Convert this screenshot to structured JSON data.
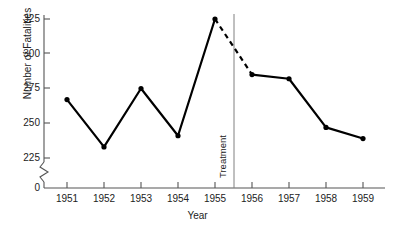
{
  "chart_data": {
    "type": "line",
    "title": "",
    "xlabel": "Year",
    "ylabel": "Number of Fatalities",
    "categories": [
      "1951",
      "1952",
      "1953",
      "1954",
      "1955",
      "1956",
      "1957",
      "1958",
      "1959"
    ],
    "values": [
      267,
      233,
      275,
      241,
      325,
      285,
      282,
      247,
      239
    ],
    "series": [
      {
        "name": "Number of Fatalities",
        "values": [
          267,
          233,
          275,
          241,
          325,
          285,
          282,
          247,
          239
        ]
      }
    ],
    "ylim": [
      225,
      325
    ],
    "yticks": [
      "0",
      "225",
      "250",
      "275",
      "300",
      "325"
    ],
    "ytick_values": [
      0,
      225,
      250,
      275,
      300,
      325
    ],
    "xticks": [
      "1951",
      "1952",
      "1953",
      "1954",
      "1955",
      "1956",
      "1957",
      "1958",
      "1959"
    ],
    "axis_break": true,
    "axis_break_label": "0",
    "grid": false,
    "legend": "none",
    "line_color": "#000000",
    "marker_color": "#000000",
    "axis_color": "#555555",
    "annotations": [
      {
        "name": "treatment-line",
        "label": "Treatment",
        "x_position": "between 1955 and 1956",
        "style": "vertical-line"
      },
      {
        "name": "dashed-transition",
        "label": "",
        "from": "1955",
        "to": "1956",
        "style": "dashed-segment"
      }
    ]
  },
  "chart": {
    "y_axis_title": "Number of Fatalities",
    "x_axis_title": "Year",
    "treatment_label": "Treatment",
    "y_tick_labels": [
      "325",
      "300",
      "275",
      "250",
      "225",
      "0"
    ],
    "x_tick_labels": [
      "1951",
      "1952",
      "1953",
      "1954",
      "1955",
      "1956",
      "1957",
      "1958",
      "1959"
    ]
  }
}
